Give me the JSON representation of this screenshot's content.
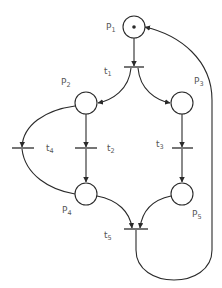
{
  "diagram": {
    "type": "petri-net",
    "places": [
      {
        "id": "p1",
        "label": "P",
        "sub": "1",
        "tokens": 1
      },
      {
        "id": "p2",
        "label": "P",
        "sub": "2",
        "tokens": 0
      },
      {
        "id": "p3",
        "label": "P",
        "sub": "3",
        "tokens": 0
      },
      {
        "id": "p4",
        "label": "P",
        "sub": "4",
        "tokens": 0
      },
      {
        "id": "p5",
        "label": "P",
        "sub": "5",
        "tokens": 0
      }
    ],
    "transitions": [
      {
        "id": "t1",
        "label": "t",
        "sub": "1"
      },
      {
        "id": "t2",
        "label": "t",
        "sub": "2"
      },
      {
        "id": "t3",
        "label": "t",
        "sub": "3"
      },
      {
        "id": "t4",
        "label": "t",
        "sub": "4"
      },
      {
        "id": "t5",
        "label": "t",
        "sub": "5"
      }
    ],
    "arcs": [
      [
        "p1",
        "t1"
      ],
      [
        "t1",
        "p2"
      ],
      [
        "t1",
        "p3"
      ],
      [
        "p2",
        "t2"
      ],
      [
        "t2",
        "p4"
      ],
      [
        "p3",
        "t3"
      ],
      [
        "t3",
        "p5"
      ],
      [
        "p2",
        "t4"
      ],
      [
        "t4",
        "p4"
      ],
      [
        "p4",
        "t5"
      ],
      [
        "p5",
        "t5"
      ],
      [
        "t5",
        "p1"
      ]
    ],
    "colors": {
      "stroke": "#2a2a2a",
      "label": "#555555",
      "background": "#ffffff"
    }
  }
}
